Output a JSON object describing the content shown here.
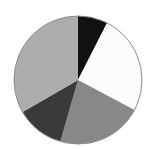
{
  "figure": {
    "background_color": "#ffffff",
    "width": 146,
    "height": 150
  },
  "chart_data": {
    "type": "pie",
    "title": "",
    "xlabel": "",
    "ylabel": "",
    "legend_position": "none",
    "grid": false,
    "center_x": 78,
    "center_y": 80,
    "radius": 64,
    "start_angle_deg": 0,
    "direction": "clockwise",
    "outline_color": "#8a8a8a",
    "outline_width": 1,
    "categories": [
      "Black",
      "White",
      "Medium Gray",
      "Dark Gray",
      "Light Gray"
    ],
    "values": [
      7.5,
      25.3,
      21.7,
      12.2,
      33.3
    ],
    "labels": [],
    "slices": [
      {
        "name": "Black",
        "color": "#111111",
        "start_angle_deg": 0,
        "end_angle_deg": 27,
        "sweep_deg": 27,
        "percent": 7.5
      },
      {
        "name": "White",
        "color": "#fbfbfb",
        "start_angle_deg": 27,
        "end_angle_deg": 118,
        "sweep_deg": 91,
        "percent": 25.3
      },
      {
        "name": "Medium Gray",
        "color": "#888888",
        "start_angle_deg": 118,
        "end_angle_deg": 196,
        "sweep_deg": 78,
        "percent": 21.7
      },
      {
        "name": "Dark Gray",
        "color": "#3a3a3a",
        "start_angle_deg": 196,
        "end_angle_deg": 240,
        "sweep_deg": 44,
        "percent": 12.2
      },
      {
        "name": "Light Gray",
        "color": "#adadad",
        "start_angle_deg": 240,
        "end_angle_deg": 360,
        "sweep_deg": 120,
        "percent": 33.3
      }
    ]
  }
}
